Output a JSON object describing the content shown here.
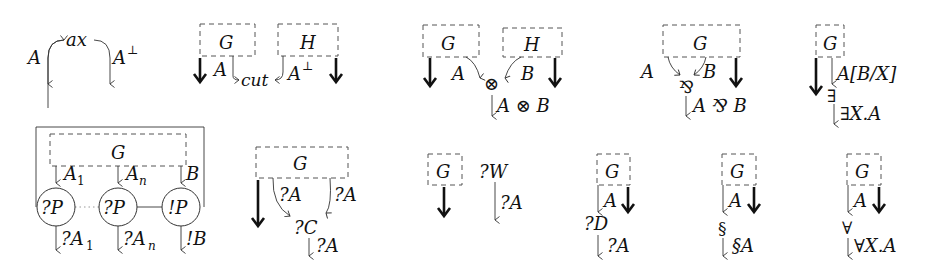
{
  "figure": {
    "panels": [
      {
        "id": "axiom",
        "link_label": "ax",
        "left": "A",
        "right": "A⊥"
      },
      {
        "id": "cut",
        "boxes": [
          "G",
          "H"
        ],
        "link_label": "cut",
        "left": "A",
        "right": "A⊥"
      },
      {
        "id": "tensor",
        "boxes": [
          "G",
          "H"
        ],
        "premises": [
          "A",
          "B"
        ],
        "node": "⊗",
        "conclusion": "A ⊗ B"
      },
      {
        "id": "par",
        "boxes": [
          "G"
        ],
        "premises": [
          "A",
          "B"
        ],
        "node": "⅋",
        "conclusion": "A ⅋ B"
      },
      {
        "id": "exists",
        "boxes": [
          "G"
        ],
        "premise": "A[B/X]",
        "node": "∃",
        "conclusion": "∃X.A"
      },
      {
        "id": "promotion",
        "boxes": [
          "G"
        ],
        "premises": [
          "A₁",
          "Aₙ",
          "B"
        ],
        "nodes": [
          "?P",
          "?P",
          "!P"
        ],
        "conclusions": [
          "?A₁",
          "?Aₙ",
          "!B"
        ]
      },
      {
        "id": "contraction",
        "boxes": [
          "G"
        ],
        "premises": [
          "?A",
          "?A"
        ],
        "node": "?C",
        "conclusion": "?A"
      },
      {
        "id": "weakening",
        "boxes": [
          "G"
        ],
        "node": "?W",
        "conclusion": "?A"
      },
      {
        "id": "dereliction",
        "boxes": [
          "G"
        ],
        "premise": "A",
        "node": "?D",
        "conclusion": "?A"
      },
      {
        "id": "paragraph",
        "boxes": [
          "G"
        ],
        "premise": "A",
        "node": "§",
        "conclusion": "§A"
      },
      {
        "id": "forall",
        "boxes": [
          "G"
        ],
        "premise": "A",
        "node": "∀",
        "conclusion": "∀X.A"
      }
    ]
  },
  "labels": {
    "G": "G",
    "H": "H",
    "A": "A",
    "B": "B",
    "A_perp": "A",
    "perp": "⊥",
    "ax": "ax",
    "cut": "cut",
    "tensor": "⊗",
    "tensor_concl": "A ⊗ B",
    "par": "⅋",
    "par_concl": "A ⅋ B",
    "subst": "A[B/X]",
    "exists": "∃",
    "exists_concl": "∃X.A",
    "A1": "A",
    "sub1": "1",
    "An": "A",
    "subn": "n",
    "qP": "?P",
    "bP": "!P",
    "qA1": "?A",
    "qAn": "?A",
    "bB": "!B",
    "qA": "?A",
    "qC": "?C",
    "qW": "?W",
    "qD": "?D",
    "sect": "§",
    "sectA": "§A",
    "forall": "∀",
    "forall_concl": "∀X.A"
  }
}
